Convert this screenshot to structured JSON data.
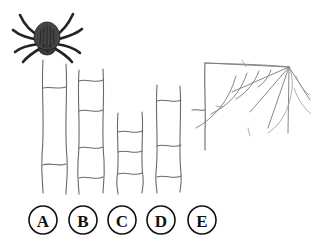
{
  "scene": {
    "title": "Spider maze puzzle",
    "background_color": "#ffffff",
    "line_color": "#6a6a6a",
    "ink_color": "#111111"
  },
  "spider": {
    "name": "spider",
    "color": "#2b2b2b",
    "position": {
      "x": 47,
      "y": 38
    },
    "leg_count": 8
  },
  "web": {
    "name": "spider-web",
    "color": "#7a7a7a",
    "hub": {
      "x": 289,
      "y": 67
    },
    "spoke_count": 5,
    "arc_count": 4
  },
  "ladder": {
    "name": "ladder-paths",
    "strip_count": 5,
    "columns": [
      {
        "id": "A",
        "x_left": 43,
        "x_right": 66,
        "top": 60,
        "bottom": 192
      },
      {
        "id": "B",
        "x_left": 79,
        "x_right": 103,
        "top": 70,
        "bottom": 193
      },
      {
        "id": "C",
        "x_left": 118,
        "x_right": 142,
        "top": 113,
        "bottom": 193
      },
      {
        "id": "D",
        "x_left": 157,
        "x_right": 180,
        "top": 85,
        "bottom": 192
      },
      {
        "id": "E",
        "x_left": 192,
        "x_right": 205,
        "top": 63,
        "bottom": 150
      }
    ]
  },
  "options": {
    "name": "answer-options",
    "radius": 14,
    "center_y": 220,
    "items": [
      {
        "label": "A",
        "cx": 43
      },
      {
        "label": "B",
        "cx": 83
      },
      {
        "label": "C",
        "cx": 122
      },
      {
        "label": "D",
        "cx": 161
      },
      {
        "label": "E",
        "cx": 202
      }
    ]
  }
}
